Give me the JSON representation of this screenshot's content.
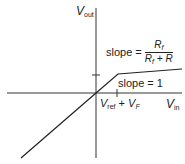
{
  "diagram": {
    "y_axis_label": {
      "main": "V",
      "sub": "out"
    },
    "x_axis_label": {
      "main": "V",
      "sub": "in"
    },
    "x_tick_label": {
      "a_main": "V",
      "a_sub": "ref",
      "op": " + ",
      "b_main": "V",
      "b_sub": "F"
    },
    "slope_upper": {
      "prefix": "slope = ",
      "num_main": "R",
      "num_sub": "f",
      "den_main": "R",
      "den_sub": "f",
      "den_rest": " + R"
    },
    "slope_lower": "slope = 1",
    "colors": {
      "line": "#222222",
      "background": "#ffffff"
    }
  }
}
